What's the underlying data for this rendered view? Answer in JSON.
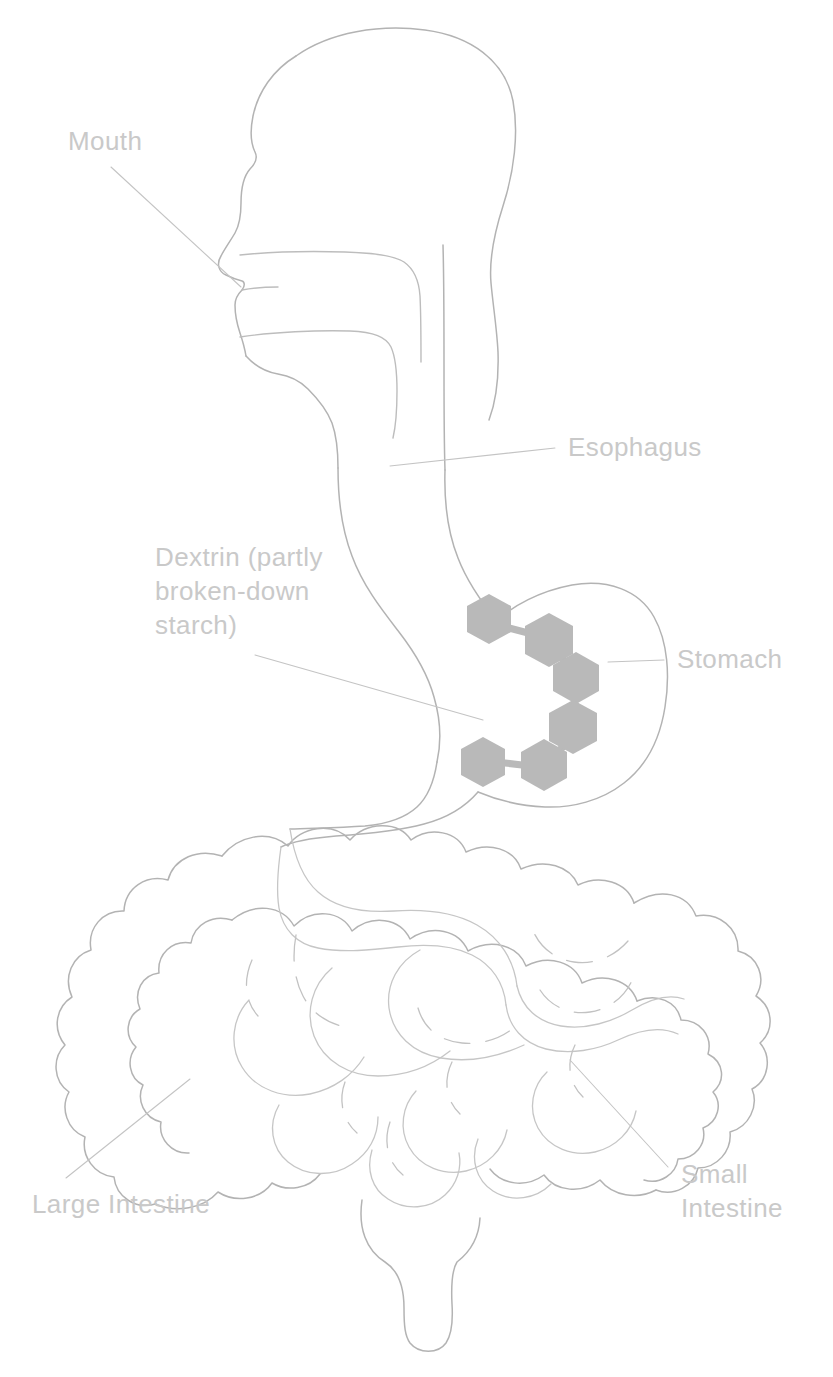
{
  "diagram": {
    "background_color": "#ffffff",
    "line_color": "#b3b3b3",
    "label_color": "#c9c9c9",
    "molecule_color": "#b9b9b9"
  },
  "labels": {
    "mouth": {
      "text": "Mouth",
      "x": 68,
      "y": 150
    },
    "esophagus": {
      "text": "Esophagus",
      "x": 568,
      "y": 456
    },
    "dextrin": {
      "line1": "Dextrin (partly",
      "line2": "broken-down",
      "line3": "starch)",
      "x": 155,
      "y": 566
    },
    "stomach": {
      "text": "Stomach",
      "x": 677,
      "y": 668
    },
    "large_intestine": {
      "text": "Large Intestine",
      "x": 32,
      "y": 1213
    },
    "small_intestine": {
      "line1": "Small",
      "line2": "Intestine",
      "x": 681,
      "y": 1183
    }
  },
  "organs": [
    {
      "name": "mouth",
      "label": "Mouth"
    },
    {
      "name": "esophagus",
      "label": "Esophagus"
    },
    {
      "name": "stomach",
      "label": "Stomach"
    },
    {
      "name": "small-intestine",
      "label": "Small Intestine"
    },
    {
      "name": "large-intestine",
      "label": "Large Intestine"
    }
  ],
  "molecule": {
    "name": "dextrin",
    "description": "Dextrin (partly broken-down starch)",
    "unit_count": 6,
    "unit_shape": "hexagon",
    "fill_color": "#b9b9b9",
    "location": "stomach",
    "units": [
      {
        "cx": 489,
        "cy": 619,
        "r": 25
      },
      {
        "cx": 549,
        "cy": 640,
        "r": 27
      },
      {
        "cx": 576,
        "cy": 678,
        "r": 26
      },
      {
        "cx": 573,
        "cy": 727,
        "r": 27
      },
      {
        "cx": 544,
        "cy": 765,
        "r": 26
      },
      {
        "cx": 483,
        "cy": 762,
        "r": 25
      }
    ],
    "bonds": [
      {
        "x1": 509,
        "y1": 628,
        "x2": 530,
        "y2": 634
      },
      {
        "x1": 563,
        "y1": 658,
        "x2": 570,
        "y2": 666
      },
      {
        "x1": 575,
        "y1": 700,
        "x2": 574,
        "y2": 710
      },
      {
        "x1": 564,
        "y1": 746,
        "x2": 556,
        "y2": 753
      },
      {
        "x1": 522,
        "y1": 765,
        "x2": 505,
        "y2": 763
      }
    ]
  }
}
